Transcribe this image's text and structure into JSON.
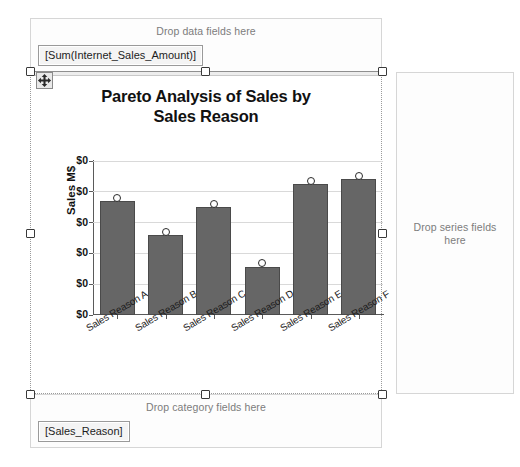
{
  "dropzones": {
    "data": {
      "label": "Drop data fields here",
      "field": "[Sum(Internet_Sales_Amount)]"
    },
    "category": {
      "label": "Drop category fields here",
      "field": "[Sales_Reason]"
    },
    "series": {
      "label": "Drop series fields here"
    }
  },
  "chart_data": {
    "type": "bar",
    "title": "Pareto Analysis of Sales by Sales Reason",
    "title_line1": "Pareto Analysis of Sales by",
    "title_line2": "Sales Reason",
    "xlabel": "",
    "ylabel": "Sales M$",
    "categories": [
      "Sales Reason A",
      "Sales Reason B",
      "Sales Reason C",
      "Sales Reason D",
      "Sales Reason E",
      "Sales Reason F"
    ],
    "ytick_labels": [
      "$0",
      "$0",
      "$0",
      "$0",
      "$0",
      "$0"
    ],
    "ylim": [
      0,
      5
    ],
    "grid": true,
    "legend": "none",
    "series": [
      {
        "name": "Bars",
        "type": "bar",
        "color": "#666666",
        "values": [
          3.7,
          2.6,
          3.5,
          1.55,
          4.25,
          4.4
        ]
      },
      {
        "name": "Markers",
        "type": "scatter",
        "color": "#ffffff",
        "values": [
          3.8,
          2.7,
          3.6,
          1.7,
          4.35,
          4.5
        ]
      }
    ]
  },
  "selection": {
    "move_handle_icon": "move-4-way-arrow-icon",
    "handles": 8
  }
}
